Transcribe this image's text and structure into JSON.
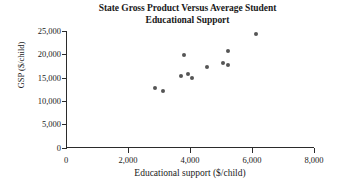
{
  "chart": {
    "title_line1": "State Gross Product Versus Average Student",
    "title_line2": "Educational Support",
    "marker_color": "#555555",
    "axis_color": "#2b2b2b"
  },
  "chart_data": {
    "type": "scatter",
    "title": "State Gross Product Versus Average Student Educational Support",
    "xlabel": "Educational support ($/child)",
    "ylabel": "GSP ($/child)",
    "xlim": [
      0,
      8000
    ],
    "ylim": [
      0,
      25000
    ],
    "xticks": [
      0,
      2000,
      4000,
      6000,
      8000
    ],
    "xticklabels": [
      "0",
      "2,000",
      "4,000",
      "6,000",
      "8,000"
    ],
    "yticks": [
      0,
      5000,
      10000,
      15000,
      20000,
      25000
    ],
    "yticklabels": [
      "0",
      "5,000",
      "10,000",
      "15,000",
      "20,000",
      "25,000"
    ],
    "grid": false,
    "legend": false,
    "points": [
      {
        "x": 2870,
        "y": 12800
      },
      {
        "x": 3130,
        "y": 12200
      },
      {
        "x": 3710,
        "y": 15400
      },
      {
        "x": 3810,
        "y": 19900
      },
      {
        "x": 3940,
        "y": 15800
      },
      {
        "x": 4060,
        "y": 15000
      },
      {
        "x": 4550,
        "y": 17300
      },
      {
        "x": 5060,
        "y": 18200
      },
      {
        "x": 5230,
        "y": 20700
      },
      {
        "x": 5230,
        "y": 17700
      },
      {
        "x": 6130,
        "y": 24400
      }
    ]
  }
}
